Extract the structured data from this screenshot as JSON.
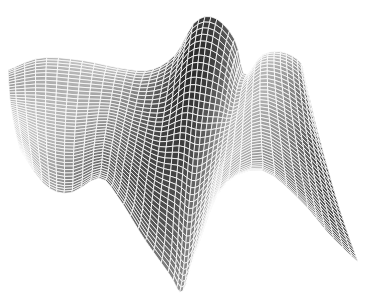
{
  "chart_data": {
    "type": "surface",
    "title": "",
    "xlabel": "",
    "ylabel": "",
    "zlabel": "",
    "axes_visible": false,
    "grid": "white mesh lines",
    "colormap": "grayscale",
    "background": "#ffffff",
    "mesh_color": "#ffffff",
    "rows": 40,
    "cols": 44,
    "boundary": {
      "top": [
        [
          8,
          70
        ],
        [
          40,
          58
        ],
        [
          80,
          60
        ],
        [
          120,
          68
        ],
        [
          150,
          70
        ],
        [
          175,
          55
        ],
        [
          195,
          22
        ],
        [
          215,
          18
        ],
        [
          235,
          40
        ],
        [
          245,
          75
        ],
        [
          262,
          55
        ],
        [
          282,
          52
        ],
        [
          300,
          62
        ],
        [
          305,
          78
        ]
      ],
      "bottom": [
        [
          20,
          150
        ],
        [
          45,
          185
        ],
        [
          70,
          193
        ],
        [
          100,
          178
        ],
        [
          120,
          200
        ],
        [
          145,
          240
        ],
        [
          170,
          275
        ],
        [
          182,
          292
        ],
        [
          195,
          255
        ],
        [
          220,
          190
        ],
        [
          260,
          170
        ],
        [
          300,
          200
        ],
        [
          330,
          235
        ],
        [
          358,
          262
        ]
      ],
      "left": [
        [
          8,
          70
        ],
        [
          10,
          100
        ],
        [
          14,
          125
        ],
        [
          20,
          150
        ]
      ],
      "right": [
        [
          305,
          78
        ],
        [
          320,
          140
        ],
        [
          340,
          210
        ],
        [
          358,
          262
        ]
      ]
    }
  }
}
